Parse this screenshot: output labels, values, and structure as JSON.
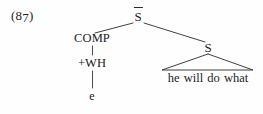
{
  "figure": {
    "example_number_prefix": "(8",
    "example_number_sub": "7",
    "example_number_suffix": ")",
    "example_number_full": "(87)",
    "caption": "",
    "background_color": "#fefefe",
    "ink_color": "#1b1b1b",
    "line_color": "#2a2a2a"
  },
  "tree": {
    "type": "constituency-tree",
    "root": "S-bar",
    "nodes": [
      {
        "id": "sbar",
        "label": "S",
        "has_overbar": true,
        "display": "S̄",
        "role": "root",
        "x": 138,
        "y": 10
      },
      {
        "id": "comp",
        "label": "COMP",
        "has_overbar": false,
        "display": "COMP",
        "role": "left-daughter",
        "x": 92,
        "y": 32
      },
      {
        "id": "wh",
        "label": "+WH",
        "has_overbar": false,
        "display": "+WH",
        "role": "feature",
        "x": 92,
        "y": 57
      },
      {
        "id": "e",
        "label": "e",
        "has_overbar": false,
        "display": "e",
        "role": "empty-category",
        "x": 92,
        "y": 90
      },
      {
        "id": "s",
        "label": "S",
        "has_overbar": false,
        "display": "S",
        "role": "right-daughter",
        "x": 208,
        "y": 41
      }
    ],
    "terminal_string": "he will do what",
    "terminal_words": [
      "he",
      "will",
      "do",
      "what"
    ],
    "edges": [
      {
        "from": "sbar",
        "to": "comp",
        "style": "diagonal"
      },
      {
        "from": "sbar",
        "to": "s",
        "style": "diagonal"
      },
      {
        "from": "comp",
        "to": "wh",
        "style": "vertical"
      },
      {
        "from": "wh",
        "to": "e",
        "style": "vertical"
      },
      {
        "from": "s",
        "to": "terminal_string",
        "style": "triangle"
      }
    ]
  }
}
